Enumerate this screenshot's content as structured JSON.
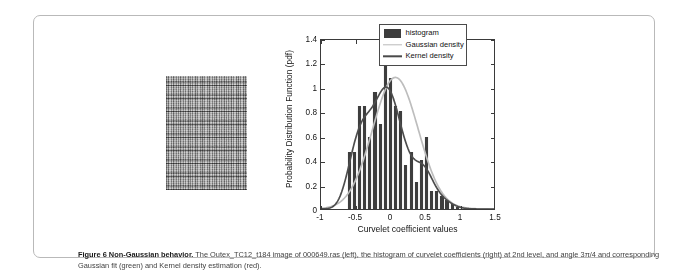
{
  "figure": {
    "caption_bold": "Figure 6 Non-Gaussian behavior.",
    "caption_rest": " The Outex_TC12_t184 image of 000649.ras (left), the histogram of curvelet coefficients (right) at 2nd level, and angle 3π/4 and corresponding Gaussian fit (green) and Kernel density estimation (red)."
  },
  "texture_panel": {
    "name": "outex-texture-image",
    "description": "Outex_TC12_t184 grayscale canvas texture 000649.ras"
  },
  "legend": {
    "items": [
      {
        "label": "histogram",
        "key": "patch",
        "color": "#3d3d3d"
      },
      {
        "label": "Gaussian density",
        "key": "line",
        "color": "#b9b9b9"
      },
      {
        "label": "Kernel density",
        "key": "line",
        "color": "#4a4a4a"
      }
    ]
  },
  "chart_data": {
    "type": "bar",
    "title": "",
    "xlabel": "Curvelet coefficient values",
    "ylabel": "Probability Distribution Function (pdf)",
    "xlim": [
      -1,
      1.5
    ],
    "ylim": [
      0,
      1.4
    ],
    "xticks": [
      -1,
      -0.5,
      0,
      0.5,
      1,
      1.5
    ],
    "xticklabels": [
      "-1",
      "-0.5",
      "0",
      "0.5",
      "1",
      "1.5"
    ],
    "yticks": [
      0,
      0.2,
      0.4,
      0.6,
      0.8,
      1,
      1.2,
      1.4
    ],
    "yticklabels": [
      "0",
      "0.2",
      "0.4",
      "0.6",
      "0.8",
      "1",
      "1.2",
      "1.4"
    ],
    "grid": false,
    "legend_position": "upper right",
    "bin_width": 0.0735,
    "bin_centers": [
      -0.595,
      -0.522,
      -0.448,
      -0.375,
      -0.301,
      -0.228,
      -0.154,
      -0.081,
      -0.007,
      0.066,
      0.14,
      0.213,
      0.287,
      0.36,
      0.434,
      0.507,
      0.581,
      0.654,
      0.728,
      0.801,
      0.875,
      0.948
    ],
    "values": [
      0.47,
      0.47,
      0.84,
      0.84,
      0.59,
      0.96,
      0.7,
      1.31,
      1.07,
      0.84,
      0.8,
      0.36,
      0.47,
      0.22,
      0.4,
      0.59,
      0.15,
      0.15,
      0.11,
      0.07,
      0.04,
      0.02
    ],
    "series": [
      {
        "name": "Gaussian density",
        "type": "line",
        "color": "#b9b9b9",
        "mean": 0.075,
        "sigma": 0.33,
        "peak": 1.09
      },
      {
        "name": "Kernel density",
        "type": "line",
        "color": "#4a4a4a",
        "peak": 1.01,
        "peak_x": 0.18
      }
    ]
  }
}
